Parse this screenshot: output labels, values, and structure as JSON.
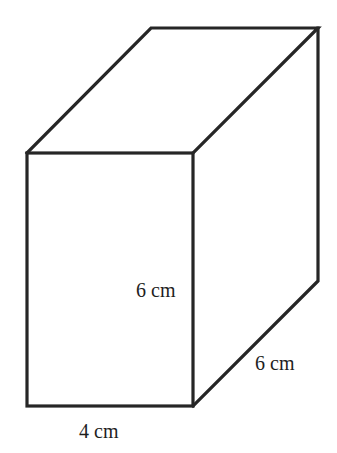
{
  "figure": {
    "type": "rectangular-prism",
    "stroke_color": "#262626",
    "background": "#ffffff",
    "labels": {
      "height": "6 cm",
      "depth": "6 cm",
      "width": "4 cm"
    },
    "vertices": {
      "front_top_left": [
        27,
        153
      ],
      "front_top_right": [
        193,
        153
      ],
      "front_bottom_left": [
        27,
        406
      ],
      "front_bottom_right": [
        193,
        406
      ],
      "back_top_left": [
        151,
        28
      ],
      "back_top_right": [
        318,
        28
      ],
      "back_bottom_right": [
        318,
        281
      ]
    }
  }
}
